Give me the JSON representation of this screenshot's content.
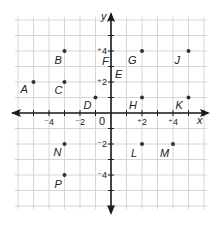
{
  "diagram": {
    "type": "coordinate-plane",
    "colors": {
      "grid": "#d6d6d6",
      "axis": "#1a1a1a",
      "point": "#333333",
      "text": "#222222"
    },
    "x_axis": {
      "label": "x",
      "range": [
        -6,
        6
      ],
      "tick_labels": [
        {
          "value": -4,
          "text": "⁻4"
        },
        {
          "value": -2,
          "text": "⁻2"
        },
        {
          "value": 2,
          "text": "⁺2"
        },
        {
          "value": 4,
          "text": "⁺4"
        }
      ]
    },
    "y_axis": {
      "label": "y",
      "range": [
        -6,
        6
      ],
      "tick_labels": [
        {
          "value": 4,
          "text": "⁺4"
        },
        {
          "value": 2,
          "text": "⁺2"
        },
        {
          "value": -2,
          "text": "⁻2"
        },
        {
          "value": -4,
          "text": "⁻4"
        }
      ]
    },
    "origin_label": "0",
    "points": [
      {
        "name": "A",
        "x": -5,
        "y": 2
      },
      {
        "name": "B",
        "x": -3,
        "y": 4
      },
      {
        "name": "C",
        "x": -3,
        "y": 2
      },
      {
        "name": "D",
        "x": -1,
        "y": 1
      },
      {
        "name": "E",
        "x": 0,
        "y": 2
      },
      {
        "name": "F",
        "x": 0,
        "y": 4
      },
      {
        "name": "G",
        "x": 2,
        "y": 4
      },
      {
        "name": "H",
        "x": 2,
        "y": 1
      },
      {
        "name": "J",
        "x": 5,
        "y": 4
      },
      {
        "name": "K",
        "x": 5,
        "y": 1
      },
      {
        "name": "L",
        "x": 2,
        "y": -2
      },
      {
        "name": "M",
        "x": 4,
        "y": -2
      },
      {
        "name": "N",
        "x": -3,
        "y": -2
      },
      {
        "name": "P",
        "x": -3,
        "y": -4
      }
    ]
  }
}
